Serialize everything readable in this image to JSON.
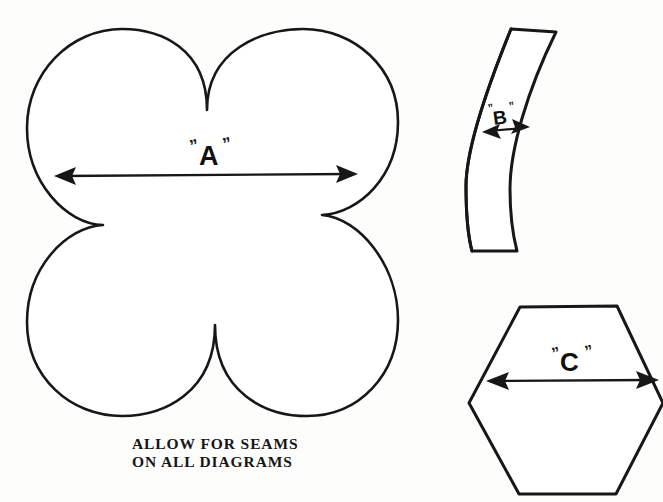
{
  "page": {
    "background_color": "#fdfdfc",
    "ink_color": "#171717",
    "width": 663,
    "height": 502
  },
  "caption": {
    "line1": "ALLOW FOR SEAMS",
    "line2": "ON ALL DIAGRAMS"
  },
  "shapes": [
    {
      "id": "clover",
      "name": "four-lobe-clover-template",
      "label": "A",
      "label_quoted": "\"A\"",
      "left_quote": "”",
      "right_quote": "”",
      "dimension": "width across",
      "bounds": {
        "x": 27,
        "y": 29,
        "width": 371,
        "height": 387
      }
    },
    {
      "id": "curved-strip",
      "name": "curved-strip-template",
      "label": "B",
      "label_quoted": "\"B\"",
      "left_quote": "”",
      "right_quote": "”",
      "dimension": "strip width",
      "bounds": {
        "x": 465,
        "y": 28,
        "width": 95,
        "height": 226
      }
    },
    {
      "id": "hexagon",
      "name": "hexagon-template",
      "label": "C",
      "label_quoted": "\"C\"",
      "left_quote": "”",
      "right_quote": "”",
      "dimension": "point to point width",
      "bounds": {
        "x": 468,
        "y": 305,
        "width": 195,
        "height": 191
      }
    }
  ],
  "icons": {
    "double_arrow": "double-headed-arrow-icon"
  }
}
